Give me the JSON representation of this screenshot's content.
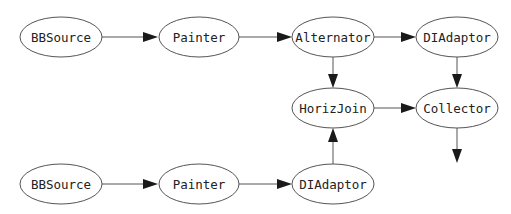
{
  "diagram": {
    "type": "directed-graph",
    "nodes": [
      {
        "id": "bbsource1",
        "label": "BBSource",
        "cx": 61,
        "cy": 37
      },
      {
        "id": "painter1",
        "label": "Painter",
        "cx": 199,
        "cy": 37
      },
      {
        "id": "alternator",
        "label": "Alternator",
        "cx": 333,
        "cy": 37
      },
      {
        "id": "diadaptor1",
        "label": "DIAdaptor",
        "cx": 457,
        "cy": 37
      },
      {
        "id": "horizjoin",
        "label": "HorizJoin",
        "cx": 334,
        "cy": 108
      },
      {
        "id": "collector",
        "label": "Collector",
        "cx": 457,
        "cy": 108
      },
      {
        "id": "bbsource2",
        "label": "BBSource",
        "cx": 61,
        "cy": 184
      },
      {
        "id": "painter2",
        "label": "Painter",
        "cx": 199,
        "cy": 184
      },
      {
        "id": "diadaptor2",
        "label": "DIAdaptor",
        "cx": 333,
        "cy": 184
      }
    ],
    "edges": [
      {
        "from": "bbsource1",
        "to": "painter1"
      },
      {
        "from": "painter1",
        "to": "alternator"
      },
      {
        "from": "alternator",
        "to": "diadaptor1"
      },
      {
        "from": "alternator",
        "to": "horizjoin"
      },
      {
        "from": "diadaptor1",
        "to": "collector"
      },
      {
        "from": "horizjoin",
        "to": "collector"
      },
      {
        "from": "bbsource2",
        "to": "painter2"
      },
      {
        "from": "painter2",
        "to": "diadaptor2"
      },
      {
        "from": "diadaptor2",
        "to": "horizjoin"
      },
      {
        "from": "collector",
        "to": "output"
      }
    ],
    "colors": {
      "stroke": "#555555",
      "arrowhead": "#1a1a1a",
      "background": "#ffffff"
    }
  }
}
